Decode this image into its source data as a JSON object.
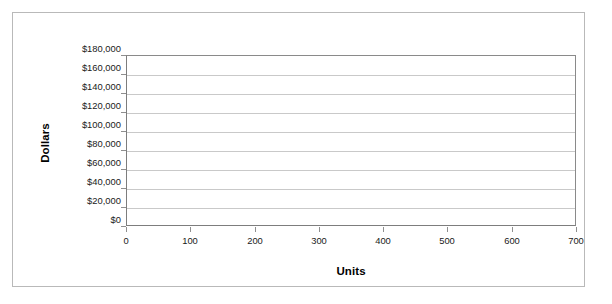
{
  "chart_data": {
    "type": "line",
    "title": "",
    "subtitle": "",
    "xlabel": "Units",
    "ylabel": "Dollars",
    "xlim": [
      0,
      700
    ],
    "ylim": [
      0,
      180000
    ],
    "xticks": [
      0,
      100,
      200,
      300,
      400,
      500,
      600,
      700
    ],
    "xticklabels": [
      "0",
      "100",
      "200",
      "300",
      "400",
      "500",
      "600",
      "700"
    ],
    "yticks": [
      0,
      20000,
      40000,
      60000,
      80000,
      100000,
      120000,
      140000,
      160000,
      180000
    ],
    "yticklabels": [
      "$0",
      "$20,000",
      "$40,000",
      "$60,000",
      "$80,000",
      "$100,000",
      "$120,000",
      "$140,000",
      "$160,000",
      "$180,000"
    ],
    "grid": true,
    "grid_axis": "y",
    "legend": false,
    "legend_position": "none",
    "series": [],
    "annotations": [],
    "colors": {
      "plot_background": "#ffffff",
      "figure_background": "#ffffff",
      "gridline": "#c9c9c9",
      "axis_line": "#808080",
      "frame_border": "#b9b9b9",
      "tick_label": "#1a1a1a",
      "axis_title": "#000000"
    }
  }
}
